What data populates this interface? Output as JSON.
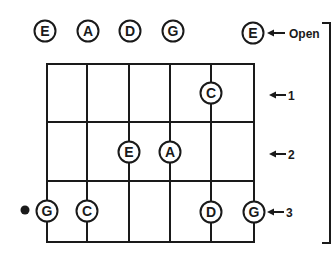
{
  "diagram": {
    "type": "guitar-fretboard-note-chart",
    "colors": {
      "ink": "#1a1a1a",
      "background": "#ffffff"
    },
    "open_strings": [
      {
        "note": "E",
        "x": 45
      },
      {
        "note": "A",
        "x": 88
      },
      {
        "note": "D",
        "x": 130
      },
      {
        "note": "G",
        "x": 173
      },
      {
        "note": "E",
        "x": 253
      }
    ],
    "fret_labels": {
      "open": "Open",
      "fret1": "1",
      "fret2": "2",
      "fret3": "3"
    },
    "fretted_notes": [
      {
        "note": "C",
        "string": 5,
        "fret": 1
      },
      {
        "note": "E",
        "string": 3,
        "fret": 2
      },
      {
        "note": "A",
        "string": 4,
        "fret": 2
      },
      {
        "note": "G",
        "string": 1,
        "fret": 3
      },
      {
        "note": "C",
        "string": 2,
        "fret": 3
      },
      {
        "note": "D",
        "string": 5,
        "fret": 3
      },
      {
        "note": "G",
        "string": 6,
        "fret": 3
      }
    ],
    "marker": {
      "type": "dot",
      "near_note": "G",
      "fret": 3
    }
  }
}
